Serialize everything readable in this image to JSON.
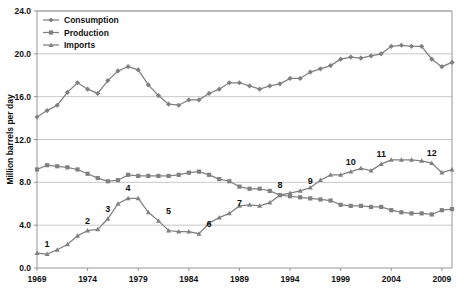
{
  "chart_data": {
    "type": "line",
    "title": "",
    "subtitle": "",
    "xlabel": "",
    "ylabel": "Million barrels per day",
    "xlim": [
      1969,
      2010
    ],
    "ylim": [
      0.0,
      24.0
    ],
    "grid": true,
    "legend_position": "top-left",
    "y_ticks": [
      "0.0",
      "4.0",
      "8.0",
      "12.0",
      "16.0",
      "20.0",
      "24.0"
    ],
    "y_tick_values": [
      0.0,
      4.0,
      8.0,
      12.0,
      16.0,
      20.0,
      24.0
    ],
    "x_ticks": [
      "1969",
      "1974",
      "1979",
      "1984",
      "1989",
      "1994",
      "1999",
      "2004",
      "2009"
    ],
    "x_tick_values": [
      1969,
      1974,
      1979,
      1984,
      1989,
      1994,
      1999,
      2004,
      2009
    ],
    "x": [
      1969,
      1970,
      1971,
      1972,
      1973,
      1974,
      1975,
      1976,
      1977,
      1978,
      1979,
      1980,
      1981,
      1982,
      1983,
      1984,
      1985,
      1986,
      1987,
      1988,
      1989,
      1990,
      1991,
      1992,
      1993,
      1994,
      1995,
      1996,
      1997,
      1998,
      1999,
      2000,
      2001,
      2002,
      2003,
      2004,
      2005,
      2006,
      2007,
      2008,
      2009,
      2010
    ],
    "series": [
      {
        "name": "Consumption",
        "marker": "diamond",
        "color": "#808080",
        "values": [
          14.1,
          14.7,
          15.2,
          16.4,
          17.3,
          16.7,
          16.3,
          17.5,
          18.4,
          18.8,
          18.5,
          17.1,
          16.1,
          15.3,
          15.2,
          15.7,
          15.7,
          16.3,
          16.7,
          17.3,
          17.3,
          17.0,
          16.7,
          17.0,
          17.2,
          17.7,
          17.7,
          18.3,
          18.6,
          18.9,
          19.5,
          19.7,
          19.6,
          19.8,
          20.0,
          20.7,
          20.8,
          20.7,
          20.7,
          19.5,
          18.8,
          19.2
        ]
      },
      {
        "name": "Production",
        "marker": "square",
        "color": "#808080",
        "values": [
          9.2,
          9.6,
          9.5,
          9.4,
          9.2,
          8.8,
          8.4,
          8.1,
          8.2,
          8.7,
          8.6,
          8.6,
          8.6,
          8.6,
          8.7,
          8.9,
          9.0,
          8.7,
          8.3,
          8.1,
          7.6,
          7.4,
          7.4,
          7.2,
          6.8,
          6.7,
          6.6,
          6.5,
          6.4,
          6.3,
          5.9,
          5.8,
          5.8,
          5.7,
          5.7,
          5.4,
          5.2,
          5.1,
          5.1,
          5.0,
          5.4,
          5.5
        ]
      },
      {
        "name": "Imports",
        "marker": "triangle",
        "color": "#808080",
        "values": [
          1.4,
          1.3,
          1.7,
          2.2,
          3.0,
          3.5,
          3.6,
          4.6,
          6.0,
          6.5,
          6.5,
          5.2,
          4.4,
          3.5,
          3.4,
          3.4,
          3.2,
          4.2,
          4.7,
          5.1,
          5.8,
          5.9,
          5.8,
          6.1,
          6.8,
          7.0,
          7.2,
          7.5,
          8.2,
          8.7,
          8.7,
          9.0,
          9.3,
          9.1,
          9.7,
          10.1,
          10.1,
          10.1,
          10.0,
          9.8,
          8.9,
          9.2
        ]
      }
    ],
    "annotations": [
      {
        "label": "1",
        "x": 1970,
        "y": 1.3
      },
      {
        "label": "2",
        "x": 1974,
        "y": 3.5
      },
      {
        "label": "3",
        "x": 1976,
        "y": 4.6
      },
      {
        "label": "4",
        "x": 1978,
        "y": 6.5
      },
      {
        "label": "5",
        "x": 1982,
        "y": 4.4
      },
      {
        "label": "6",
        "x": 1986,
        "y": 3.2
      },
      {
        "label": "7",
        "x": 1989,
        "y": 5.1
      },
      {
        "label": "8",
        "x": 1993,
        "y": 6.8
      },
      {
        "label": "9",
        "x": 1996,
        "y": 7.2
      },
      {
        "label": "10",
        "x": 2000,
        "y": 9.0
      },
      {
        "label": "11",
        "x": 2003,
        "y": 9.7
      },
      {
        "label": "12",
        "x": 2008,
        "y": 9.8
      }
    ]
  },
  "legend": {
    "items": [
      {
        "label": "Consumption"
      },
      {
        "label": "Production"
      },
      {
        "label": "Imports"
      }
    ]
  },
  "axis": {
    "y_title": "Million barrels per day"
  }
}
